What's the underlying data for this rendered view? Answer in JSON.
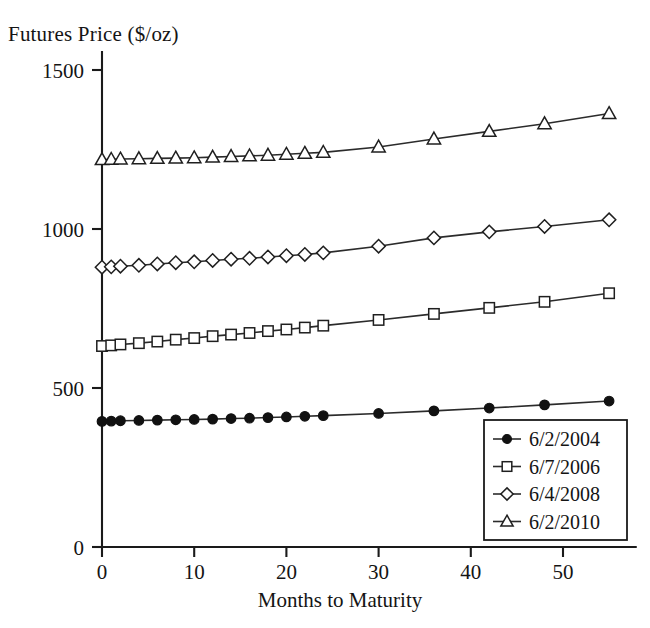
{
  "chart_data": {
    "type": "line",
    "title": "",
    "xlabel": "Months to Maturity",
    "ylabel": "Futures Price ($/oz)",
    "xlim": [
      0,
      58
    ],
    "ylim": [
      0,
      1560
    ],
    "xticks": [
      "0",
      "10",
      "20",
      "30",
      "40",
      "50"
    ],
    "xtick_values": [
      0,
      10,
      20,
      30,
      40,
      50
    ],
    "yticks": [
      "0",
      "500",
      "1000",
      "1500"
    ],
    "ytick_values": [
      0,
      500,
      1000,
      1500
    ],
    "grid": false,
    "legend_position": "lower right",
    "x": [
      0,
      1,
      2,
      4,
      6,
      8,
      10,
      12,
      14,
      16,
      18,
      20,
      22,
      24,
      30,
      36,
      42,
      48,
      55
    ],
    "series": [
      {
        "name": "6/2/2004",
        "marker": "filled-circle",
        "values": [
          395,
          396,
          397,
          398,
          399,
          400,
          401,
          402,
          404,
          405,
          407,
          409,
          411,
          413,
          420,
          428,
          437,
          447,
          459
        ]
      },
      {
        "name": "6/7/2006",
        "marker": "open-square",
        "values": [
          632,
          634,
          637,
          641,
          646,
          652,
          657,
          663,
          668,
          673,
          679,
          684,
          690,
          696,
          714,
          733,
          752,
          771,
          798
        ]
      },
      {
        "name": "6/4/2008",
        "marker": "open-diamond",
        "values": [
          880,
          881,
          883,
          886,
          890,
          894,
          897,
          901,
          905,
          908,
          912,
          916,
          920,
          925,
          946,
          972,
          991,
          1008,
          1029
        ]
      },
      {
        "name": "6/2/2010",
        "marker": "open-triangle",
        "values": [
          1218,
          1219,
          1220,
          1221,
          1222,
          1223,
          1224,
          1226,
          1228,
          1230,
          1232,
          1235,
          1238,
          1241,
          1258,
          1283,
          1307,
          1331,
          1363
        ]
      }
    ]
  },
  "legend": {
    "items": [
      {
        "label": "6/2/2004",
        "marker": "filled-circle"
      },
      {
        "label": "6/7/2006",
        "marker": "open-square"
      },
      {
        "label": "6/4/2008",
        "marker": "open-diamond"
      },
      {
        "label": "6/2/2010",
        "marker": "open-triangle"
      }
    ]
  },
  "axes": {
    "y_axis_label": "Futures Price ($/oz)",
    "x_axis_label": "Months to Maturity",
    "y_tick_labels": [
      "1500",
      "1000",
      "500",
      "0"
    ],
    "x_tick_labels": [
      "0",
      "10",
      "20",
      "30",
      "40",
      "50"
    ]
  },
  "colors": {
    "line": "#2b2b2b",
    "marker_stroke": "#1f1f1f",
    "marker_fill": "#ffffff",
    "filled_marker": "#111111",
    "axis": "#1a1a1a",
    "background": "#ffffff",
    "text": "#141414"
  }
}
